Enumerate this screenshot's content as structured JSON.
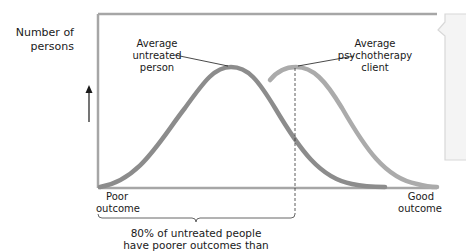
{
  "diagram": {
    "y_axis_label_line1": "Number of",
    "y_axis_label_line2": "persons",
    "x_axis_left_line1": "Poor",
    "x_axis_left_line2": "outcome",
    "x_axis_right_line1": "Good",
    "x_axis_right_line2": "outcome",
    "untreated_label_line1": "Average",
    "untreated_label_line2": "untreated",
    "untreated_label_line3": "person",
    "client_label_line1": "Average",
    "client_label_line2": "psychotherapy",
    "client_label_line3": "client",
    "bracket_caption_line1": "80% of untreated people",
    "bracket_caption_line2": "have poorer outcomes than",
    "colors": {
      "frame": "#a6a6a6",
      "untreated_curve": "#8c8c8c",
      "client_curve": "#ababab",
      "text": "#1a1a1a"
    }
  }
}
